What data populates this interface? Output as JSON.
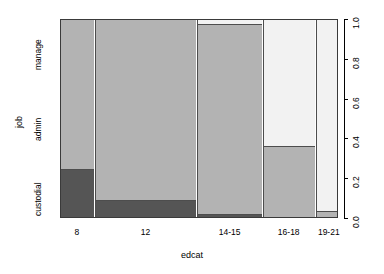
{
  "chart_data": {
    "type": "bar",
    "subtype": "spineplot",
    "title": "",
    "xlabel": "edcat",
    "ylabel": "job",
    "categories": [
      "8",
      "12",
      "14-15",
      "16-18",
      "19-21"
    ],
    "category_widths_pct": [
      12.1,
      36.6,
      23.2,
      18.6,
      9.5
    ],
    "stack_levels": [
      "custodial",
      "admin",
      "manage"
    ],
    "ylim": [
      0,
      1
    ],
    "ytick_labels": [
      "0.0",
      "0.2",
      "0.4",
      "0.6",
      "0.8",
      "1.0"
    ],
    "ytick_values": [
      0.0,
      0.2,
      0.4,
      0.6,
      0.8,
      1.0
    ],
    "y_axis_position": "right",
    "grid": false,
    "legend": "none",
    "colors": {
      "custodial": "#555555",
      "admin": "#b3b3b3",
      "manage": "#f2f2f2",
      "border": "#4d4d4d",
      "background": "#ffffff",
      "axis": "#000000"
    },
    "series": [
      {
        "name": "custodial",
        "values": [
          0.245,
          0.09,
          0.02,
          0.0,
          0.0
        ]
      },
      {
        "name": "admin",
        "values": [
          0.755,
          0.91,
          0.955,
          0.36,
          0.035
        ]
      },
      {
        "name": "manage",
        "values": [
          0.0,
          0.0,
          0.025,
          0.64,
          0.965
        ]
      }
    ]
  },
  "axes": {
    "x_title": "edcat",
    "y_title": "job"
  }
}
